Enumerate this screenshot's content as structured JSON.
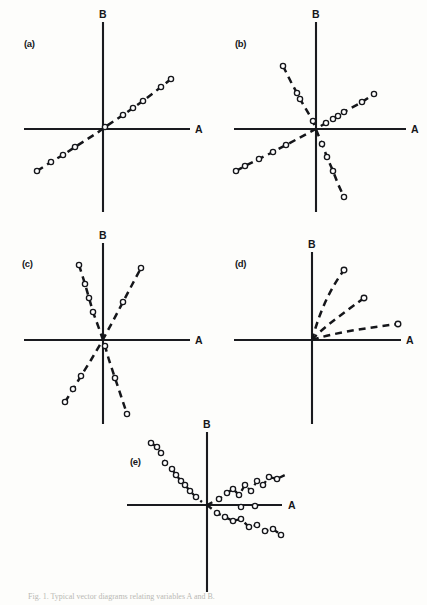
{
  "figure": {
    "background_color": "#fdfdfb",
    "ink_color": "#15161a",
    "caption": "Fig. 1. Typical vector diagrams relating variables A and B.",
    "axis_labels": {
      "horizontal": "A",
      "vertical": "B"
    }
  },
  "panels": [
    {
      "tag": "(a)",
      "description": "single straight dashed line of open-circle points passing through the origin with a moderate positive slope, extending into quadrant I and quadrant III",
      "origin": {
        "x": 103,
        "y": 129
      },
      "axis_extent": {
        "x_min": 24,
        "x_max": 190,
        "y_min": 22,
        "y_max": 212
      },
      "series": [
        {
          "name": "positive-slope-line",
          "points": [
            [
              -66,
              -42
            ],
            [
              -52,
              -33
            ],
            [
              -40,
              -26
            ],
            [
              -28,
              -18
            ],
            [
              -6,
              -4
            ],
            [
              2,
              2
            ],
            [
              20,
              14
            ],
            [
              30,
              21
            ],
            [
              40,
              28
            ],
            [
              58,
              42
            ],
            [
              68,
              50
            ]
          ]
        }
      ]
    },
    {
      "tag": "(b)",
      "description": "two dashed lines crossing at the origin: one with a steep negative slope and one with a shallow positive slope",
      "origin": {
        "x": 316,
        "y": 129
      },
      "axis_extent": {
        "x_min": 234,
        "x_max": 406,
        "y_min": 22,
        "y_max": 212
      },
      "series": [
        {
          "name": "steep-negative-line",
          "points": [
            [
              -33,
              63
            ],
            [
              -25,
              47
            ],
            [
              -19,
              36
            ],
            [
              -16,
              30
            ],
            [
              -3,
              8
            ],
            [
              -1,
              2
            ],
            [
              6,
              -15
            ],
            [
              11,
              -28
            ],
            [
              17,
              -42
            ],
            [
              22,
              -55
            ],
            [
              28,
              -68
            ]
          ]
        },
        {
          "name": "shallow-positive-line",
          "points": [
            [
              -80,
              -42
            ],
            [
              -71,
              -37
            ],
            [
              -57,
              -30
            ],
            [
              -43,
              -23
            ],
            [
              -30,
              -16
            ],
            [
              -2,
              -1
            ],
            [
              10,
              6
            ],
            [
              17,
              10
            ],
            [
              22,
              13
            ],
            [
              28,
              17
            ],
            [
              46,
              27
            ],
            [
              58,
              35
            ]
          ]
        }
      ]
    },
    {
      "tag": "(c)",
      "description": "two steep dashed lines crossing at the origin, one leaning left and one leaning right, both close to the vertical axis",
      "origin": {
        "x": 103,
        "y": 340
      },
      "axis_extent": {
        "x_min": 24,
        "x_max": 190,
        "y_min": 243,
        "y_max": 424
      },
      "series": [
        {
          "name": "steep-left-leaning-line",
          "points": [
            [
              -24,
              75
            ],
            [
              -18,
              56
            ],
            [
              -14,
              42
            ],
            [
              -10,
              28
            ],
            [
              -2,
              6
            ],
            [
              2,
              -6
            ],
            [
              6,
              -20
            ],
            [
              12,
              -38
            ],
            [
              18,
              -56
            ],
            [
              24,
              -74
            ]
          ]
        },
        {
          "name": "steep-right-leaning-line",
          "points": [
            [
              -38,
              -62
            ],
            [
              -30,
              -49
            ],
            [
              -22,
              -36
            ],
            [
              -12,
              -20
            ],
            [
              -2,
              -3
            ],
            [
              10,
              19
            ],
            [
              20,
              38
            ],
            [
              30,
              57
            ],
            [
              38,
              72
            ]
          ]
        }
      ]
    },
    {
      "tag": "(d)",
      "description": "three dashed rays fanning out from the origin into the first quadrant only, each ending in a single open circle marker",
      "origin": {
        "x": 312,
        "y": 340
      },
      "axis_extent": {
        "x_min": 234,
        "x_max": 404,
        "y_min": 252,
        "y_max": 424
      },
      "series": [
        {
          "name": "steep-ray",
          "points": [
            [
              0,
              0
            ],
            [
              12,
              26
            ],
            [
              22,
              48
            ],
            [
              32,
              70
            ]
          ]
        },
        {
          "name": "medium-ray",
          "points": [
            [
              0,
              0
            ],
            [
              18,
              13
            ],
            [
              33,
              26
            ],
            [
              52,
              42
            ]
          ]
        },
        {
          "name": "shallow-ray",
          "points": [
            [
              0,
              0
            ],
            [
              30,
              5
            ],
            [
              58,
              11
            ],
            [
              86,
              16
            ]
          ]
        }
      ]
    },
    {
      "tag": "(e)",
      "description": "three noisy scattered trends about the origin: a steep descending cluster in quadrant II, a rising scatter band in quadrant I, and a falling scatter band in quadrant IV",
      "origin": {
        "x": 207,
        "y": 505
      },
      "axis_extent": {
        "x_min": 127,
        "x_max": 297,
        "y_min": 432,
        "y_max": 592
      },
      "series": [
        {
          "name": "steep-negative-scatter",
          "points": [
            [
              -56,
              62
            ],
            [
              -50,
              58
            ],
            [
              -46,
              52
            ],
            [
              -42,
              42
            ],
            [
              -35,
              36
            ],
            [
              -31,
              30
            ],
            [
              -26,
              24
            ],
            [
              -22,
              20
            ],
            [
              -17,
              14
            ],
            [
              -11,
              8
            ],
            [
              -5,
              3
            ]
          ]
        },
        {
          "name": "rising-scatter-band",
          "points": [
            [
              12,
              6
            ],
            [
              20,
              12
            ],
            [
              26,
              16
            ],
            [
              32,
              10
            ],
            [
              38,
              20
            ],
            [
              44,
              14
            ],
            [
              50,
              24
            ],
            [
              56,
              20
            ],
            [
              62,
              28
            ],
            [
              70,
              26
            ],
            [
              78,
              30
            ],
            [
              86,
              28
            ],
            [
              94,
              32
            ],
            [
              34,
              -2
            ],
            [
              48,
              -3
            ]
          ]
        },
        {
          "name": "falling-scatter-band",
          "points": [
            [
              10,
              -8
            ],
            [
              18,
              -12
            ],
            [
              26,
              -16
            ],
            [
              34,
              -14
            ],
            [
              42,
              -22
            ],
            [
              50,
              -20
            ],
            [
              58,
              -26
            ],
            [
              66,
              -24
            ],
            [
              74,
              -30
            ],
            [
              82,
              -28
            ],
            [
              90,
              -34
            ],
            [
              98,
              -40
            ],
            [
              106,
              -44
            ]
          ]
        }
      ]
    }
  ]
}
